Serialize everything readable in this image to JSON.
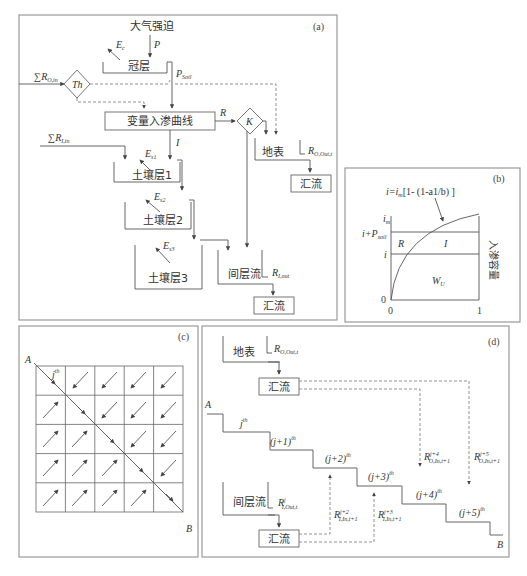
{
  "panel_a": {
    "tag": "(a)",
    "forcing": "大气强迫",
    "precip": "P",
    "canopy_evap": "E",
    "canopy_evap_sub": "c",
    "canopy": "冠层",
    "p_soil": "P",
    "p_soil_sub": "Soil",
    "sum_r_o_in": "∑R",
    "sum_r_o_in_sub": "O,in",
    "threshold": "Th",
    "infil_curve": "变量入渗曲线",
    "runoff": "R",
    "k_node": "K",
    "surface": "地表",
    "r_o_out": "R",
    "r_o_out_sub": "O,Out,t",
    "sum_r_i_in": "∑R",
    "sum_r_i_in_sub": "I,in",
    "infil": "I",
    "es1": "E",
    "es1_sub": "s1",
    "soil1": "土壤层1",
    "es2": "E",
    "es2_sub": "s2",
    "soil2": "土壤层2",
    "es3": "E",
    "es3_sub": "s3",
    "soil3": "土壤层3",
    "interflow": "间层流",
    "r_i_out": "R",
    "r_i_out_sub": "I,out",
    "confluence1": "汇流",
    "confluence2": "汇流"
  },
  "panel_b": {
    "tag": "(b)",
    "formula": "i=i",
    "formula_sub": "m",
    "formula_rest": "[1- (1-a1/b) ]",
    "y_im": "i",
    "y_im_sub": "m",
    "y_ip": "i+P",
    "y_ip_sub": "soil",
    "y_i": "i",
    "y_0": "0",
    "x_0": "0",
    "x_1": "1",
    "region_r": "R",
    "region_i": "I",
    "region_wu": "W",
    "region_wu_sub": "U",
    "region_wu_sup": "j",
    "side_label": "入渗容量"
  },
  "panel_c": {
    "tag": "(c)",
    "point_a": "A",
    "point_b": "B",
    "cell_label": "j",
    "cell_label_sup": "th",
    "grid_rows": 5,
    "grid_cols": 5
  },
  "panel_d": {
    "tag": "(d)",
    "surface": "地表",
    "r_top": "R",
    "r_top_sub": "O,Out,t",
    "r_top_sup": "j",
    "confluence_top": "汇流",
    "point_a": "A",
    "point_b": "B",
    "steps": [
      "j",
      "(j+1)",
      "(j+2)",
      "(j+3)",
      "(j+4)",
      "(j+5)"
    ],
    "step_sup": "th",
    "interflow": "间层流",
    "r_bottom": "R",
    "r_bottom_sub": "I,Out,t",
    "r_bottom_sup": "j",
    "confluence_bottom": "汇流",
    "r_o4": "R",
    "r_o4_sub": "O,In,t+1",
    "r_o4_sup": "j+4",
    "r_o5": "R",
    "r_o5_sub": "O,In,t+1",
    "r_o5_sup": "j+5",
    "r_i2": "R",
    "r_i2_sub": "I,In,t+1",
    "r_i2_sup": "j+2",
    "r_i3": "R",
    "r_i3_sub": "I,In,t+1",
    "r_i3_sup": "j+3"
  }
}
